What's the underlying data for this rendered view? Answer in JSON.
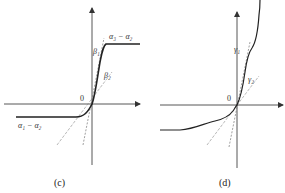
{
  "panels": [
    {
      "id": "c",
      "caption": "(c)",
      "origin_label": "0",
      "labels": {
        "upper_plateau": "α₃ − α₂",
        "lower_plateau": "α₁ − α₂",
        "slope1": "β₁",
        "slope2": "β₂"
      }
    },
    {
      "id": "d",
      "caption": "(d)",
      "origin_label": "0",
      "labels": {
        "slope1": "γ₁",
        "slope2": "γ₂"
      }
    }
  ],
  "colors": {
    "axis": "#444444",
    "curve": "#222222",
    "dashed": "#777777"
  }
}
